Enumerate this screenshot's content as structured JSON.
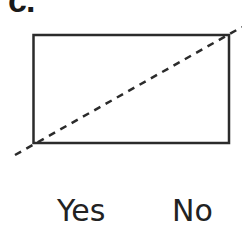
{
  "part_label": "c.",
  "diagram": {
    "shape": "rectangle",
    "rectangle": {
      "x": 33,
      "y": 35,
      "width": 196,
      "height": 108
    },
    "diagonal": {
      "style": "dashed",
      "from": [
        15,
        155
      ],
      "to": [
        242,
        27
      ]
    },
    "stroke_color": "#2b2b2b"
  },
  "choices": {
    "yes_label": "Yes",
    "no_label": "No"
  }
}
